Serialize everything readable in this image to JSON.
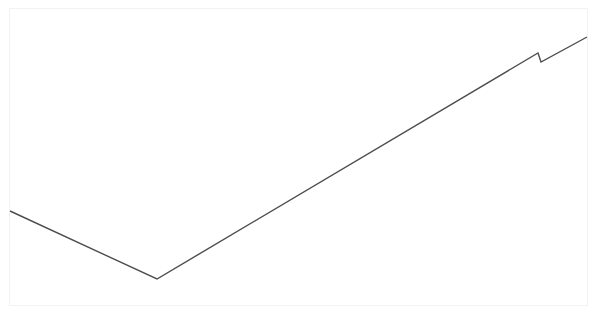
{
  "figure": {
    "title": "",
    "background_color": "#ffffff",
    "frame_color": "#f2f2f2",
    "width": 597,
    "height": 316
  },
  "chart_data": {
    "type": "line",
    "title": "",
    "subtitle": "",
    "xlabel": "",
    "ylabel": "",
    "xlim": [
      0,
      597
    ],
    "ylim": [
      0,
      316
    ],
    "grid": false,
    "legend": null,
    "legend_position": "none",
    "axis_ticks": {
      "x": [],
      "y": []
    },
    "annotations": [],
    "series": [
      {
        "name": "series-1",
        "color": "#4d4d4d",
        "line_width": 1.4,
        "marker": "none",
        "points": [
          {
            "x": 10,
            "y": 211
          },
          {
            "x": 157,
            "y": 279
          },
          {
            "x": 538,
            "y": 53
          },
          {
            "x": 541,
            "y": 62
          },
          {
            "x": 587,
            "y": 37
          }
        ],
        "segments": [
          {
            "label": "descending-segment",
            "from": [
              10,
              211
            ],
            "to": [
              157,
              279
            ]
          },
          {
            "label": "ascending-segment",
            "from": [
              157,
              279
            ],
            "to": [
              538,
              53
            ]
          },
          {
            "label": "notch-drop",
            "from": [
              538,
              53
            ],
            "to": [
              541,
              62
            ]
          },
          {
            "label": "final-ascending-segment",
            "from": [
              541,
              62
            ],
            "to": [
              587,
              37
            ]
          }
        ]
      }
    ]
  }
}
